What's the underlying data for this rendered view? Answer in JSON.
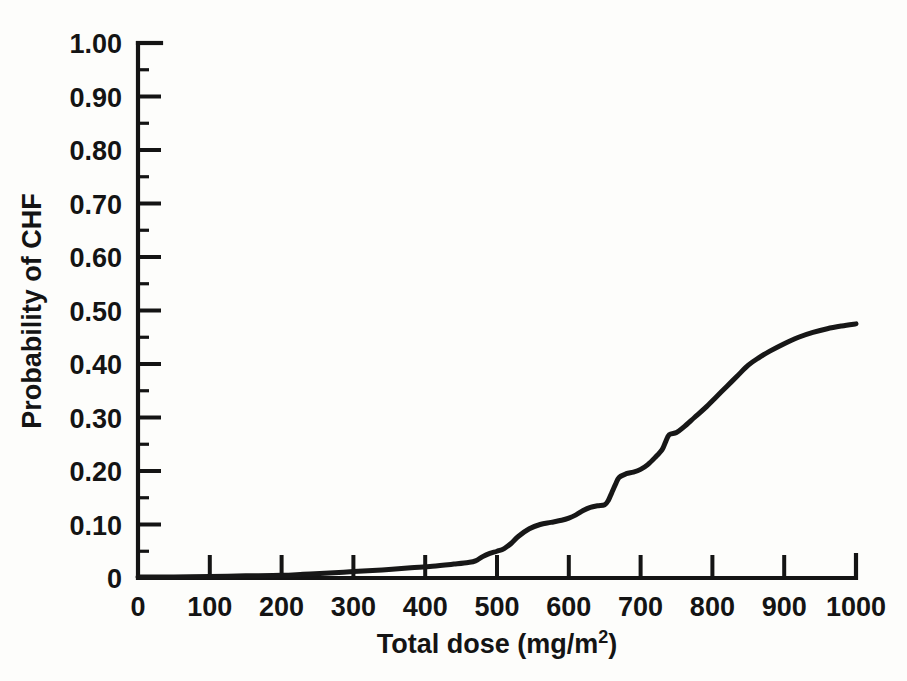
{
  "chart_data": {
    "type": "line",
    "title": "",
    "subtitle": "",
    "xlabel": "Total dose (mg/m",
    "xlabel_sup": "2",
    "xlabel_tail": ")",
    "xlabel_full": "Total dose (mg/m2)",
    "ylabel": "Probability of CHF",
    "xlim": [
      0,
      1000
    ],
    "ylim": [
      0,
      1.0
    ],
    "grid": false,
    "legend": false,
    "legend_position": "none",
    "x_ticks": [
      0,
      100,
      200,
      300,
      400,
      500,
      600,
      700,
      800,
      900,
      1000
    ],
    "x_tick_labels": [
      "0",
      "100",
      "200",
      "300",
      "400",
      "500",
      "600",
      "700",
      "800",
      "900",
      "1000"
    ],
    "y_ticks": [
      0,
      0.1,
      0.2,
      0.3,
      0.4,
      0.5,
      0.6,
      0.7,
      0.8,
      0.9,
      1.0
    ],
    "y_tick_labels": [
      "0",
      "0.10",
      "0.20",
      "0.30",
      "0.40",
      "0.50",
      "0.60",
      "0.70",
      "0.80",
      "0.90",
      "1.00"
    ],
    "y_minor_ticks": [
      0.05,
      0.15,
      0.25,
      0.35,
      0.45,
      0.55,
      0.65,
      0.75,
      0.85,
      0.95
    ],
    "series": [
      {
        "name": "Probability of CHF",
        "color": "#171717",
        "x": [
          0,
          50,
          100,
          150,
          200,
          230,
          260,
          300,
          340,
          380,
          410,
          440,
          460,
          470,
          480,
          490,
          500,
          510,
          520,
          530,
          545,
          560,
          575,
          590,
          600,
          610,
          620,
          630,
          640,
          650,
          655,
          660,
          665,
          670,
          680,
          690,
          700,
          710,
          720,
          730,
          735,
          740,
          750,
          760,
          775,
          790,
          805,
          820,
          835,
          850,
          865,
          880,
          900,
          920,
          940,
          960,
          980,
          1000
        ],
        "y": [
          0.002,
          0.002,
          0.003,
          0.004,
          0.005,
          0.007,
          0.009,
          0.012,
          0.015,
          0.019,
          0.022,
          0.026,
          0.029,
          0.032,
          0.04,
          0.046,
          0.05,
          0.055,
          0.065,
          0.078,
          0.092,
          0.1,
          0.104,
          0.108,
          0.112,
          0.118,
          0.126,
          0.132,
          0.135,
          0.137,
          0.145,
          0.16,
          0.175,
          0.188,
          0.195,
          0.198,
          0.203,
          0.212,
          0.225,
          0.24,
          0.255,
          0.268,
          0.272,
          0.282,
          0.3,
          0.318,
          0.338,
          0.358,
          0.378,
          0.398,
          0.412,
          0.424,
          0.438,
          0.45,
          0.459,
          0.466,
          0.471,
          0.475
        ]
      }
    ],
    "annotations": []
  },
  "figure": {
    "background_color": "#fdfdfb",
    "line_color": "#171717",
    "axis_color": "#141414"
  }
}
